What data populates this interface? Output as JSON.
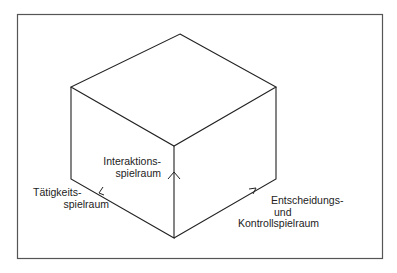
{
  "diagram": {
    "type": "isometric-cube",
    "colors": {
      "background": "#ffffff",
      "frame": "#555555",
      "lines": "#222222",
      "text": "#222222"
    },
    "labels": {
      "interaction": {
        "line1": "Interaktions-",
        "line2": "spielraum"
      },
      "activity": {
        "line1": "Tätigkeits-",
        "line2": "spielraum"
      },
      "decision": {
        "line1": "Entscheidungs-",
        "line2": "und",
        "line3": "Kontrollspielraum"
      }
    },
    "axes": [
      {
        "name": "Interaktionsspielraum",
        "direction": "up"
      },
      {
        "name": "Tätigkeitsspielraum",
        "direction": "upper-left"
      },
      {
        "name": "Entscheidungs- und Kontrollspielraum",
        "direction": "upper-right"
      }
    ]
  }
}
